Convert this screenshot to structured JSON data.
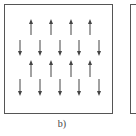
{
  "figure": {
    "caption": "b)",
    "panels": [
      {
        "id": "b",
        "description": "square panel with alternating rows of up and down arrows"
      },
      {
        "id": "next",
        "description": "partially visible adjacent panel (cropped at right edge)"
      }
    ],
    "arrow_color": "#444444",
    "border_color": "#555555",
    "rows": [
      {
        "direction": "up",
        "xs": [
          31,
          51,
          71,
          90
        ],
        "y_top": 19,
        "y_bottom": 35
      },
      {
        "direction": "down",
        "xs": [
          20,
          40,
          60,
          79,
          99
        ],
        "y_top": 40,
        "y_bottom": 56
      },
      {
        "direction": "up",
        "xs": [
          31,
          51,
          71,
          90
        ],
        "y_top": 60,
        "y_bottom": 77
      },
      {
        "direction": "down",
        "xs": [
          20,
          40,
          60,
          79,
          99
        ],
        "y_top": 79,
        "y_bottom": 96
      }
    ]
  }
}
